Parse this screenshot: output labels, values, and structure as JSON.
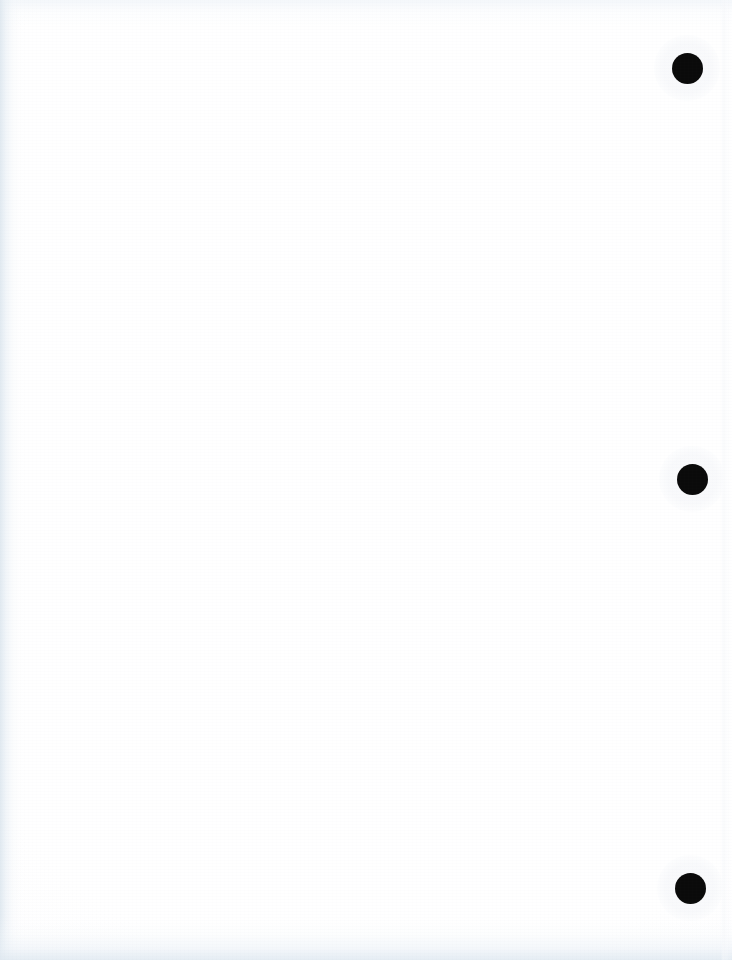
{
  "page": {
    "kind": "scanned-document-page",
    "width": 732,
    "height": 960,
    "background_color": "#ffffff",
    "content_text": "",
    "content_note": "blank page — no visible text, figures, or captions",
    "orientation": "portrait"
  },
  "colors": {
    "paper_white": "#ffffff",
    "paper_offwhite": "#fdfdfe",
    "punch_mark_black": "#0a0a0a",
    "scan_shadow_blue_gray": "#e2eaf1",
    "scan_shadow_pale": "#eef2f5",
    "page_edge_line": "#f6f8fa"
  },
  "artifacts": {
    "punch_marks": [
      {
        "name": "punch-mark-top",
        "icon": "filled-circle-icon",
        "center_x": 687,
        "center_y": 68,
        "diameter": 31
      },
      {
        "name": "punch-mark-middle",
        "icon": "filled-circle-icon",
        "center_x": 692,
        "center_y": 479,
        "diameter": 31
      },
      {
        "name": "punch-mark-bottom",
        "icon": "filled-circle-icon",
        "center_x": 690,
        "center_y": 888,
        "diameter": 31
      }
    ],
    "scan_shadows": [
      {
        "name": "scan-shadow-left",
        "edge": "left",
        "extent_px": 26
      },
      {
        "name": "scan-shadow-bottom",
        "edge": "bottom",
        "extent_px": 46
      },
      {
        "name": "scan-shadow-top",
        "edge": "top",
        "extent_px": 26
      },
      {
        "name": "page-edge-right",
        "edge": "right",
        "extent_px": 11
      }
    ]
  }
}
